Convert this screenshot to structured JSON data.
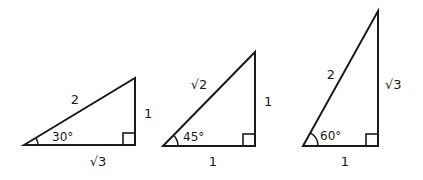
{
  "diagram": {
    "stroke_color": "#1a1a1a",
    "triangles": [
      {
        "name": "30-60-90 triangle",
        "angle_label": "30°",
        "hypotenuse_label": "2",
        "vertical_leg_label": "1",
        "base_label": "√3"
      },
      {
        "name": "45-45-90 triangle",
        "angle_label": "45°",
        "hypotenuse_label": "√2",
        "vertical_leg_label": "1",
        "base_label": "1"
      },
      {
        "name": "60-30-90 triangle",
        "angle_label": "60°",
        "hypotenuse_label": "2",
        "vertical_leg_label": "√3",
        "base_label": "1"
      }
    ]
  }
}
